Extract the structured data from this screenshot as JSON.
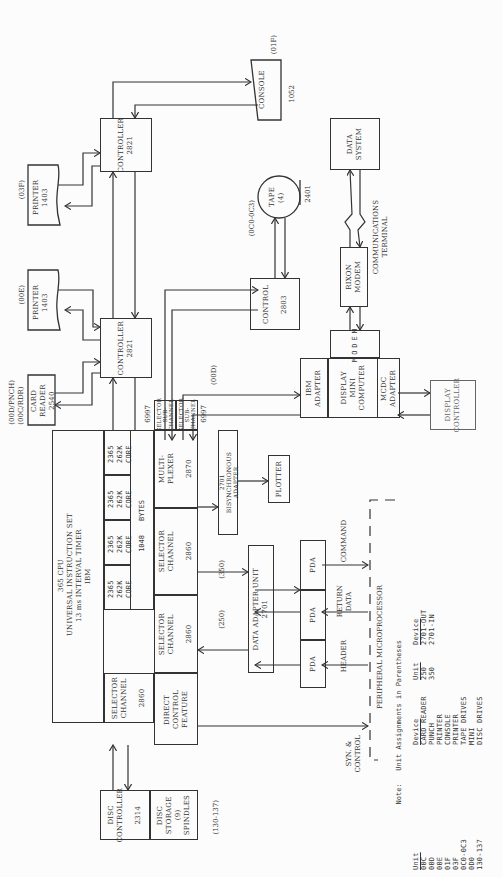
{
  "diagram": {
    "cpu": {
      "title": "365 CPU",
      "line2": "UNIVERSAL INSTRUCTION SET",
      "line3": "13 ms INTERVAL TIMER",
      "line4": "IBM",
      "memory_units": [
        {
          "model": "2365",
          "size": "262K",
          "type": "CORE"
        },
        {
          "model": "2365",
          "size": "262K",
          "type": "CORE"
        },
        {
          "model": "2365",
          "size": "262K",
          "type": "CORE"
        },
        {
          "model": "2365",
          "size": "262K",
          "type": "CORE"
        }
      ],
      "bytes_label": "1048",
      "bytes_unit": "BYTES"
    },
    "selector_channel_left": {
      "name": "SELECTOR\nCHANNEL",
      "model": "2860"
    },
    "direct_control": {
      "name": "DIRECT\nCONTROL\nFEATURE"
    },
    "selector_channel_mid": {
      "name": "SELECTOR\nCHANNEL",
      "model": "2860"
    },
    "selector_channel_right": {
      "name": "SELECTOR\nCHANNEL",
      "model": "2860"
    },
    "multiplexer": {
      "name": "MULTI-\nPLEXER",
      "model": "2870"
    },
    "selector_subchannel_1": {
      "name": "SELECTOR\nSUB-\nCHANNEL",
      "model": "6997"
    },
    "selector_subchannel_2": {
      "name": "SELECTOR\nSUB-\nCHANNEL",
      "model": "6997"
    },
    "disc_controller": {
      "name": "DISC\nCONTROLLER",
      "model": "2314"
    },
    "disc_storage": {
      "name": "DISC\nSTORAGE\n(9)\nSPINDLES"
    },
    "disc_unit": "(130-137)",
    "controller_lower": {
      "name": "CONTROLLER",
      "model": "2821"
    },
    "controller_upper": {
      "name": "CONTROLLER",
      "model": "2821"
    },
    "card_reader": {
      "name": "CARD\nREADER\n2540",
      "unit": "(00D/PNCH)\n(00C/RDR)"
    },
    "printer_00e": {
      "name": "PRINTER\n1403",
      "unit": "(00E)"
    },
    "printer_03f": {
      "name": "PRINTER\n1403",
      "unit": "(03F)"
    },
    "console": {
      "name": "CONSOLE",
      "model": "1052",
      "unit": "(01F)"
    },
    "control_2803": {
      "name": "CONTROL",
      "model": "2803"
    },
    "tape": {
      "name": "TAPE\n(4)",
      "model": "2401",
      "unit": "(0C0-0C3)"
    },
    "data_system": {
      "name": "DATA\nSYSTEM"
    },
    "comm_terminal": "COMMUNICATIONS\nTERMINAL",
    "rixon_modem": {
      "name": "RIXON\nMODEM"
    },
    "modem_small": {
      "name": "MODEM",
      "vendor": "ADAPTER"
    },
    "ibm_adapter": {
      "name": "IBM\nADAPTER"
    },
    "display_mini": {
      "name": "DISPLAY\nMINI\nCOMPUTER"
    },
    "mcdc_adapter": {
      "name": "MCDC\nADAPTER"
    },
    "display_controller": {
      "name": "DISPLAY\nCONTROLLER"
    },
    "unit_00d": "(00D)",
    "bisync_adapter": {
      "name": "2701\nBISYNCHRONOUS\nADAPTER"
    },
    "plotter": {
      "name": "PLOTTER"
    },
    "data_adapter_unit": {
      "name": "DATA ADAPTER UNIT\n2701"
    },
    "unit_350": "(350)",
    "unit_250": "(250)",
    "pda": [
      "PDA",
      "PDA",
      "PDA"
    ],
    "signals": {
      "command": "COMMAND",
      "return_data": "RETURN\nDATA",
      "header": "HEADER",
      "syn_control": "SYN. &\nCONTROL"
    },
    "peripheral_microprocessor": "PERIPHERAL MICROPROCESSOR"
  },
  "note": {
    "title": "Note:   Unit Assignments in Parentheses",
    "left_headers": [
      "Unit",
      "Device"
    ],
    "left_rows": [
      [
        "00C",
        "CARD READER"
      ],
      [
        "00D",
        "PUNCH"
      ],
      [
        "00E",
        "PRINTER"
      ],
      [
        "01F",
        "CONSOLE"
      ],
      [
        "03F",
        "PRINTER"
      ],
      [
        "0C0-0C3",
        "TAPE DRIVES"
      ],
      [
        "0D0",
        "MINI"
      ],
      [
        "130-137",
        "DISC DRIVES"
      ]
    ],
    "right_headers": [
      "Unit",
      "Device"
    ],
    "right_rows": [
      [
        "250",
        "2701-OUT"
      ],
      [
        "350",
        "2701-IN"
      ]
    ]
  }
}
